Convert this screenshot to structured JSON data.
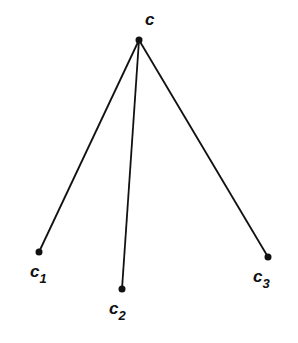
{
  "diagram": {
    "type": "tree",
    "root": {
      "id": "c",
      "label": "c",
      "x": 139,
      "y": 40,
      "label_x": 145,
      "label_y": 25
    },
    "children": [
      {
        "id": "c1",
        "label": "c",
        "sub": "1",
        "x": 39,
        "y": 252,
        "label_x": 30,
        "label_y": 277
      },
      {
        "id": "c2",
        "label": "c",
        "sub": "2",
        "x": 122,
        "y": 289,
        "label_x": 109,
        "label_y": 314
      },
      {
        "id": "c3",
        "label": "c",
        "sub": "3",
        "x": 268,
        "y": 257,
        "label_x": 253,
        "label_y": 282
      }
    ],
    "edges": [
      [
        "c",
        "c1"
      ],
      [
        "c",
        "c2"
      ],
      [
        "c",
        "c3"
      ]
    ],
    "colors": {
      "line": "#111111",
      "node": "#111111",
      "background": "#ffffff"
    }
  }
}
